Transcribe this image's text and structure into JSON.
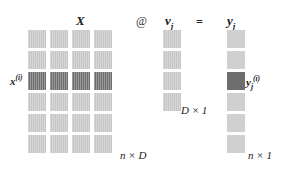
{
  "diagram": {
    "title_equation": "X @ v_j = y_j",
    "headers": {
      "matrix_x": "X",
      "operator": "@",
      "vector_v": "v",
      "vector_v_sub": "j",
      "equals": "=",
      "vector_y": "y",
      "vector_y_sub": "j"
    },
    "row_label": {
      "symbol": "x",
      "superscript": "(i)"
    },
    "result_label": {
      "symbol": "y",
      "subscript": "j",
      "superscript": "(i)"
    },
    "dimensions": {
      "matrix_x": "n × D",
      "vector_v": "D × 1",
      "vector_y": "n × 1"
    },
    "colors": {
      "cell_normal": "#c6c6c6",
      "cell_highlight": "#6e6e6e",
      "background": "#ffffff",
      "text": "#1a1a1a"
    },
    "matrix_x_grid": {
      "rows": 6,
      "cols": 4,
      "highlight_row_index": 2
    },
    "vector_v_grid": {
      "rows": 4,
      "cols": 1,
      "highlight_row_index": -1
    },
    "vector_y_grid": {
      "rows": 6,
      "cols": 1,
      "highlight_row_index": 2
    }
  }
}
